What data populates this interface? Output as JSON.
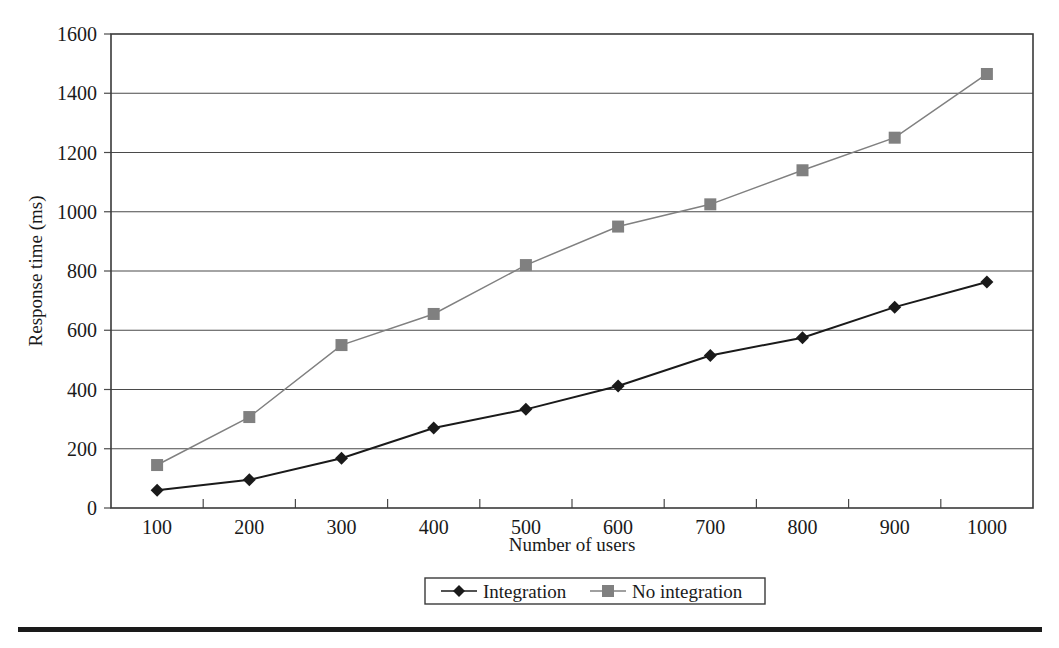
{
  "chart_data": {
    "type": "line",
    "title": "",
    "xlabel": "Number of users",
    "ylabel": "Response time (ms)",
    "categories": [
      100,
      200,
      300,
      400,
      500,
      600,
      700,
      800,
      900,
      1000
    ],
    "xtick_labels": [
      "100",
      "200",
      "300",
      "400",
      "500",
      "600",
      "700",
      "800",
      "900",
      "1000"
    ],
    "ytick_labels": [
      "0",
      "200",
      "400",
      "600",
      "800",
      "1000",
      "1200",
      "1400",
      "1600"
    ],
    "yticks": [
      0,
      200,
      400,
      600,
      800,
      1000,
      1200,
      1400,
      1600
    ],
    "ylim": [
      0,
      1600
    ],
    "grid": "horizontal",
    "legend_position": "bottom-center",
    "series": [
      {
        "name": "Integration",
        "marker": "diamond",
        "color": "#1a1a1a",
        "values": [
          60,
          95,
          168,
          270,
          333,
          412,
          515,
          575,
          678,
          763
        ]
      },
      {
        "name": "No integration",
        "marker": "square",
        "color": "#808080",
        "values": [
          145,
          307,
          550,
          655,
          820,
          950,
          1025,
          1140,
          1250,
          1465
        ]
      }
    ]
  },
  "colors": {
    "integration": "#1a1a1a",
    "no_integration": "#808080",
    "axis": "#3a3a3a",
    "grid": "#4a4a4a",
    "background": "#ffffff"
  }
}
